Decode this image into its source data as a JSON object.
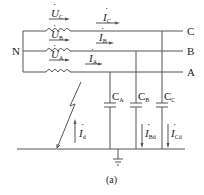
{
  "diagram": {
    "caption": "(a)",
    "neutral_label": "N",
    "phases": [
      {
        "line_label": "C",
        "source_voltage": "U",
        "source_sub": "C",
        "line_current": "I",
        "line_current_sub": "C",
        "capacitor": "C",
        "capacitor_sub": "C",
        "ground_current": "I",
        "ground_current_sub": "Cd"
      },
      {
        "line_label": "B",
        "source_voltage": "U",
        "source_sub": "B",
        "line_current": "I",
        "line_current_sub": "B",
        "capacitor": "C",
        "capacitor_sub": "B",
        "ground_current": "I",
        "ground_current_sub": "Bd"
      },
      {
        "line_label": "A",
        "source_voltage": "U",
        "source_sub": "A",
        "line_current": "I",
        "line_current_sub": "A",
        "capacitor": "C",
        "capacitor_sub": "A"
      }
    ],
    "fault_current": {
      "symbol": "I",
      "sub": "d"
    },
    "colors": {
      "line": "#555555",
      "text": "#222222",
      "background": "#ffffff"
    }
  }
}
